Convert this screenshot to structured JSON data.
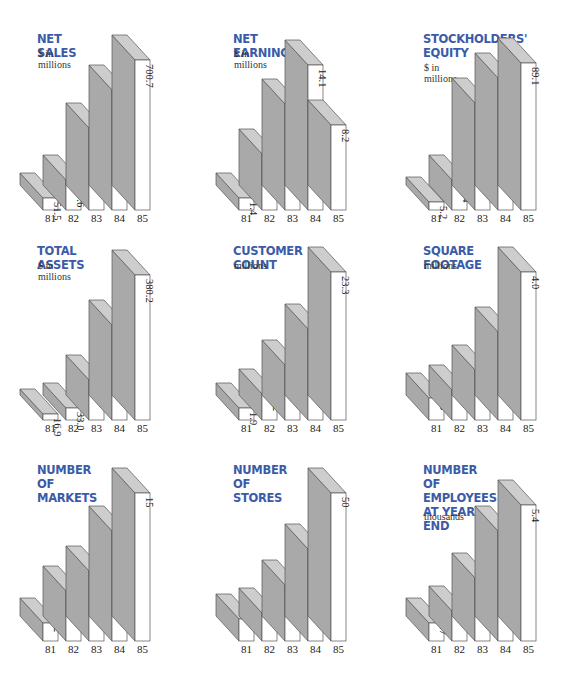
{
  "colors": {
    "title": "#3b5ba9",
    "bar_front": "#ffffff",
    "bar_side": "#a9a9a9",
    "bar_top": "#cdcdcd",
    "outline": "#555555"
  },
  "chart_data": [
    {
      "type": "bar",
      "title": "NET SALES",
      "subtitle": "$ in millions",
      "categories": [
        "81",
        "82",
        "83",
        "84",
        "85"
      ],
      "values": [
        51.5,
        117.6,
        256.2,
        432.8,
        700.7
      ],
      "value_labels": [
        "51.5",
        "117.6",
        "256.2",
        "432.8",
        "700.7"
      ],
      "ylim": [
        0,
        700.7
      ],
      "style": "3d-bar",
      "grid": false
    },
    {
      "type": "bar",
      "title": "NET EARNINGS",
      "subtitle": "$ in millions",
      "categories": [
        "81",
        "82",
        "83",
        "84",
        "85"
      ],
      "values": [
        1.4,
        5.3,
        10.3,
        14.1,
        8.2
      ],
      "value_labels": [
        "1.4",
        "5.3",
        "10.3",
        "14.1",
        "8.2"
      ],
      "ylim": [
        0,
        14.1
      ],
      "style": "3d-bar",
      "grid": false
    },
    {
      "type": "bar",
      "title": "STOCKHOLDERS'\nEQUITY",
      "subtitle": "$ in millions",
      "categories": [
        "81",
        "82",
        "83",
        "84",
        "85"
      ],
      "values": [
        5.2,
        18.4,
        65.3,
        80.2,
        89.1
      ],
      "value_labels": [
        "5.2",
        "18.4",
        "65.3",
        "80.2",
        "89.1"
      ],
      "ylim": [
        0,
        89.1
      ],
      "style": "3d-bar",
      "grid": false
    },
    {
      "type": "bar",
      "title": "TOTAL ASSETS",
      "subtitle": "$ in millions",
      "categories": [
        "81",
        "82",
        "83",
        "84",
        "85"
      ],
      "values": [
        16.9,
        33.0,
        105.2,
        249.4,
        380.2
      ],
      "value_labels": [
        "16.9",
        "33.0",
        "105.2",
        "249.4",
        "380.2"
      ],
      "ylim": [
        0,
        380.2
      ],
      "style": "3d-bar",
      "grid": false
    },
    {
      "type": "bar",
      "title": "CUSTOMER COUNT",
      "subtitle": "millions",
      "categories": [
        "81",
        "82",
        "83",
        "84",
        "85"
      ],
      "values": [
        1.9,
        4.2,
        8.5,
        14.3,
        23.3
      ],
      "value_labels": [
        "1.9",
        "4.2",
        "8.5",
        "14.3",
        "23.3"
      ],
      "ylim": [
        0,
        23.3
      ],
      "style": "3d-bar",
      "grid": false
    },
    {
      "type": "bar",
      "title": "SQUARE FOOTAGE",
      "subtitle": "millions",
      "categories": [
        "81",
        "82",
        "83",
        "84",
        "85"
      ],
      "values": [
        0.6,
        0.7,
        1.4,
        2.4,
        4.0
      ],
      "value_labels": [
        ".6",
        ".7",
        "1.4",
        "2.4",
        "4.0"
      ],
      "ylim": [
        0,
        4.0
      ],
      "style": "3d-bar",
      "grid": false
    },
    {
      "type": "bar",
      "title": "NUMBER OF\nMARKETS",
      "subtitle": "",
      "categories": [
        "81",
        "82",
        "83",
        "84",
        "85"
      ],
      "values": [
        2,
        5,
        7,
        11,
        15
      ],
      "value_labels": [
        "2",
        "5",
        "7",
        "11",
        "15"
      ],
      "ylim": [
        0,
        15
      ],
      "style": "3d-bar",
      "grid": false
    },
    {
      "type": "bar",
      "title": "NUMBER OF\nSTORES",
      "subtitle": "",
      "categories": [
        "81",
        "82",
        "83",
        "84",
        "85"
      ],
      "values": [
        8,
        10,
        19,
        31,
        50
      ],
      "value_labels": [
        "8",
        "10",
        "19",
        "31",
        "50"
      ],
      "ylim": [
        0,
        50
      ],
      "style": "3d-bar",
      "grid": false
    },
    {
      "type": "bar",
      "title": "NUMBER OF\nEMPLOYEES\nAT YEAR END",
      "subtitle": "thousands",
      "categories": [
        "81",
        "82",
        "83",
        "84",
        "85"
      ],
      "values": [
        0.7,
        1.1,
        2.4,
        4.0,
        5.4
      ],
      "value_labels": [
        ".7",
        "1.1",
        "2.4",
        "4.0",
        "5.4"
      ],
      "ylim": [
        0,
        5.4
      ],
      "style": "3d-bar",
      "grid": false
    }
  ],
  "layout": {
    "panels": [
      {
        "x": 0,
        "y": 0,
        "base_y": 210,
        "title_y": 34,
        "sub_y": 48,
        "bar_heights": [
          12,
          30,
          82,
          120,
          150
        ]
      },
      {
        "x": 196,
        "y": 0,
        "base_y": 210,
        "title_y": 34,
        "sub_y": 48,
        "bar_heights": [
          12,
          56,
          106,
          145,
          85
        ]
      },
      {
        "x": 386,
        "y": 0,
        "base_y": 210,
        "title_y": 34,
        "sub_y": 62,
        "bar_heights": [
          8,
          30,
          107,
          132,
          147
        ]
      },
      {
        "x": 0,
        "y": 224,
        "base_y": 196,
        "title_y": 22,
        "sub_y": 36,
        "bar_heights": [
          6,
          12,
          40,
          95,
          145
        ]
      },
      {
        "x": 196,
        "y": 224,
        "base_y": 196,
        "title_y": 22,
        "sub_y": 36,
        "bar_heights": [
          12,
          26,
          55,
          91,
          148
        ]
      },
      {
        "x": 386,
        "y": 224,
        "base_y": 196,
        "title_y": 22,
        "sub_y": 36,
        "bar_heights": [
          22,
          30,
          50,
          88,
          148
        ]
      },
      {
        "x": 0,
        "y": 448,
        "base_y": 193,
        "title_y": 17,
        "sub_y": 0,
        "bar_heights": [
          18,
          50,
          70,
          110,
          148
        ]
      },
      {
        "x": 196,
        "y": 448,
        "base_y": 193,
        "title_y": 17,
        "sub_y": 0,
        "bar_heights": [
          22,
          28,
          56,
          92,
          148
        ]
      },
      {
        "x": 386,
        "y": 448,
        "base_y": 193,
        "title_y": 17,
        "sub_y": 63,
        "bar_heights": [
          18,
          30,
          63,
          110,
          136
        ]
      }
    ]
  }
}
